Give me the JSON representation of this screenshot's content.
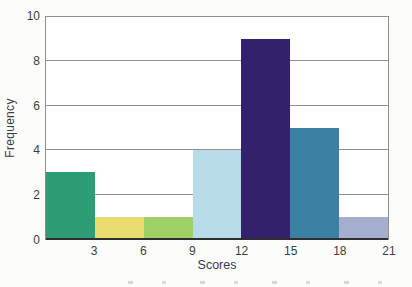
{
  "chart_data": {
    "type": "bar",
    "subtype": "histogram",
    "title": "",
    "xlabel": "Scores",
    "ylabel": "Frequency",
    "bin_edges": [
      0,
      3,
      6,
      9,
      12,
      15,
      18,
      21
    ],
    "categories": [
      "0-3",
      "3-6",
      "6-9",
      "9-12",
      "12-15",
      "15-18",
      "18-21"
    ],
    "values": [
      3,
      1,
      1,
      4,
      9,
      5,
      1
    ],
    "bar_colors": [
      "#2e9c74",
      "#e9dd6f",
      "#9ed065",
      "#b8dbea",
      "#34216e",
      "#3b80a2",
      "#a6aed0"
    ],
    "x_ticks": [
      3,
      6,
      9,
      12,
      15,
      18,
      21
    ],
    "y_ticks": [
      0,
      2,
      4,
      6,
      8,
      10
    ],
    "xlim": [
      0,
      21
    ],
    "ylim": [
      0,
      10
    ],
    "grid": "horizontal",
    "legend": "none",
    "colors": {
      "gridline": "#8f8f8f",
      "plot_border": "#8f8f8f",
      "baseline": "#2e2e2e",
      "tick_text": "#3d3d3d",
      "axis_title_text": "#3d3d3d"
    }
  }
}
